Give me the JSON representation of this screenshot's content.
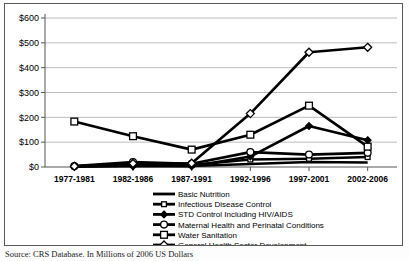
{
  "caption": {
    "source_text": "Source: CRS Database.  In Millions of 2006 US Dollars"
  },
  "chart_data": {
    "type": "line",
    "title": "",
    "xlabel": "",
    "ylabel": "",
    "ylim": [
      0,
      600
    ],
    "ytick_step": 100,
    "grid": true,
    "legend_position": "bottom",
    "currency_prefix": "$",
    "categories": [
      "1977-1981",
      "1982-1986",
      "1987-1991",
      "1992-1996",
      "1997-2001",
      "2002-2006"
    ],
    "ytick_labels": [
      "$0",
      "$100",
      "$200",
      "$300",
      "$400",
      "$500",
      "$600"
    ],
    "ytick_values": [
      0,
      100,
      200,
      300,
      400,
      500,
      600
    ],
    "series": [
      {
        "name": "Basic Nutrition",
        "marker": "none",
        "values": [
          2,
          6,
          4,
          12,
          20,
          18
        ]
      },
      {
        "name": "Infectious Disease Control",
        "marker": "square-small",
        "values": [
          3,
          10,
          8,
          30,
          33,
          40
        ]
      },
      {
        "name": "STD Control Including HIV/AIDS",
        "marker": "diamond-filled",
        "values": [
          1,
          3,
          3,
          42,
          165,
          108
        ]
      },
      {
        "name": "Maternal Health and Perinatal Conditions",
        "marker": "circle-open",
        "values": [
          4,
          20,
          13,
          60,
          50,
          57
        ]
      },
      {
        "name": "Water Sanitation",
        "marker": "square-open",
        "values": [
          183,
          124,
          70,
          130,
          247,
          82
        ]
      },
      {
        "name": "General Health Sector Development",
        "marker": "diamond-open",
        "values": [
          3,
          14,
          15,
          215,
          462,
          482
        ]
      }
    ]
  }
}
